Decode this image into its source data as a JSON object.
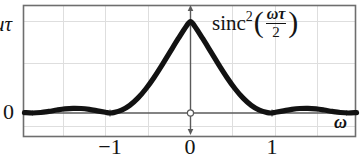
{
  "figure": {
    "title": "",
    "formula": {
      "function_name": "sinc",
      "exponent": "2",
      "open_paren": "(",
      "numerator": "ωτ",
      "fraction_bar": "",
      "denominator": "2",
      "close_paren": ")"
    },
    "y_axis": {
      "top_label": "uτ",
      "zero_label": "0"
    },
    "x_axis": {
      "label": "ω",
      "ticks": [
        "−1",
        "0",
        "1"
      ]
    },
    "colors": {
      "curve": "#121212",
      "frame": "#6e6e6e",
      "grid": "#dcdcdc",
      "axis": "#5a5a5a",
      "text": "#141414",
      "background": "#ffffff"
    }
  },
  "chart_data": {
    "type": "line",
    "xlabel": "ω",
    "ylabel": "uτ",
    "xlim": [
      -2.05,
      2.05
    ],
    "ylim": [
      -0.06,
      1.08
    ],
    "grid": true,
    "legend": false,
    "xticks": [
      -1,
      0,
      1
    ],
    "xticklabels": [
      "−1",
      "0",
      "1"
    ],
    "yticks": [
      0,
      1
    ],
    "yticklabels": [
      "0",
      "uτ"
    ],
    "annotations": [
      {
        "text": "sinc^2(ωτ/2)",
        "x": 0.6,
        "y": 1.0
      }
    ],
    "series": [
      {
        "name": "sinc^2(ωτ/2)",
        "x": [
          -2.05,
          -1.95,
          -1.85,
          -1.75,
          -1.65,
          -1.55,
          -1.45,
          -1.35,
          -1.25,
          -1.15,
          -1.05,
          -1.0,
          -0.95,
          -0.85,
          -0.75,
          -0.65,
          -0.55,
          -0.45,
          -0.35,
          -0.25,
          -0.15,
          -0.05,
          0.0,
          0.05,
          0.15,
          0.25,
          0.35,
          0.45,
          0.55,
          0.65,
          0.75,
          0.85,
          0.95,
          1.0,
          1.05,
          1.15,
          1.25,
          1.35,
          1.45,
          1.55,
          1.65,
          1.75,
          1.85,
          1.95,
          2.05
        ],
        "y": [
          0.0023,
          0.0,
          0.0026,
          0.0085,
          0.0157,
          0.0218,
          0.0249,
          0.0239,
          0.0191,
          0.0116,
          0.0038,
          0.0,
          0.0019,
          0.0152,
          0.0407,
          0.0789,
          0.1291,
          0.1893,
          0.2564,
          0.3269,
          0.3969,
          0.4635,
          0.4869,
          0.4635,
          0.3969,
          0.3269,
          0.2564,
          0.1893,
          0.1291,
          0.0789,
          0.0407,
          0.0152,
          0.0019,
          0.0,
          0.0038,
          0.0116,
          0.0191,
          0.0239,
          0.0249,
          0.0218,
          0.0157,
          0.0085,
          0.0026,
          0.0,
          0.0023
        ]
      }
    ]
  }
}
